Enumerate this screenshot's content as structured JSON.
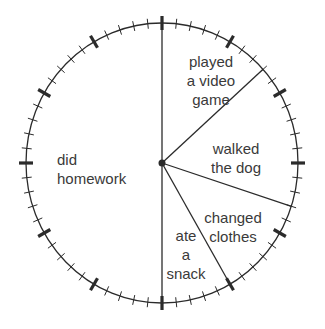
{
  "chart_data": {
    "type": "pie",
    "style": "clock-face",
    "title": "",
    "total_minutes": 60,
    "unit": "minutes",
    "categories": [
      "played a video game",
      "walked the dog",
      "changed clothes",
      "ate a snack",
      "did homework"
    ],
    "values": [
      8,
      10,
      7,
      5,
      30
    ],
    "segments": [
      {
        "label": "played a video game",
        "start_minute": 0,
        "end_minute": 8,
        "minutes": 8
      },
      {
        "label": "walked the dog",
        "start_minute": 8,
        "end_minute": 18,
        "minutes": 10
      },
      {
        "label": "changed clothes",
        "start_minute": 18,
        "end_minute": 25,
        "minutes": 7
      },
      {
        "label": "ate a snack",
        "start_minute": 25,
        "end_minute": 30,
        "minutes": 5
      },
      {
        "label": "did homework",
        "start_minute": 30,
        "end_minute": 60,
        "minutes": 30
      }
    ],
    "boundary_minutes": [
      0,
      8,
      18,
      25,
      30
    ],
    "ticks": {
      "minor_every_minutes": 1,
      "major_every_minutes": 5,
      "count": 60
    },
    "grid": false,
    "legend": "none (labels inside sectors)"
  },
  "labels": {
    "video_game": {
      "line1": "played",
      "line2": "a video",
      "line3": "game"
    },
    "walked_dog": {
      "line1": "walked",
      "line2": "the dog"
    },
    "changed_clothes": {
      "line1": "changed",
      "line2": "clothes"
    },
    "ate_snack": {
      "line1": "ate",
      "line2": "a",
      "line3": "snack"
    },
    "homework": {
      "line1": "did",
      "line2": "homework"
    }
  },
  "colors": {
    "stroke": "#2b2b2b",
    "text": "#3a3a3a",
    "background": "#ffffff"
  }
}
